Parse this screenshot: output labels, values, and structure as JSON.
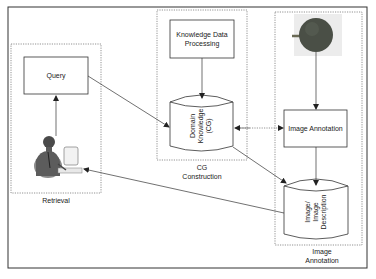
{
  "diagram": {
    "regions": {
      "retrieval": {
        "label": "Retrieval"
      },
      "cg_construction": {
        "label_line1": "CG",
        "label_line2": "Construction"
      },
      "image_annotation": {
        "label_line1": "Image",
        "label_line2": "Annotation"
      }
    },
    "nodes": {
      "query": {
        "label": "Query"
      },
      "knowledge_data_processing": {
        "line1": "Knowledge Data",
        "line2": "Processing"
      },
      "domain_knowledge": {
        "line1": "Domain",
        "line2": "Knowledge",
        "line3": "(CG)"
      },
      "image_annotation_process": {
        "label": "Image Annotation"
      },
      "image_description": {
        "line1": "Image/",
        "line2": "Image",
        "line3": "Description"
      },
      "user_icon": {
        "name": "user-at-computer-icon"
      },
      "fruit_image": {
        "name": "fruit-image"
      }
    },
    "colors": {
      "line": "#333333",
      "dotted": "#777777",
      "fruit": "#4a4f46",
      "fruit_bg": "#e6e6e6"
    }
  }
}
